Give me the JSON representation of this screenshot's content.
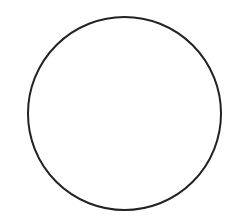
{
  "canvas": {
    "width": 232,
    "height": 217,
    "background": "#ffffff"
  },
  "shapes": [
    {
      "type": "circle",
      "cx": 124.5,
      "cy": 113.5,
      "r": 96.5,
      "stroke": "#222222",
      "stroke_width": 2,
      "fill": "none"
    }
  ]
}
